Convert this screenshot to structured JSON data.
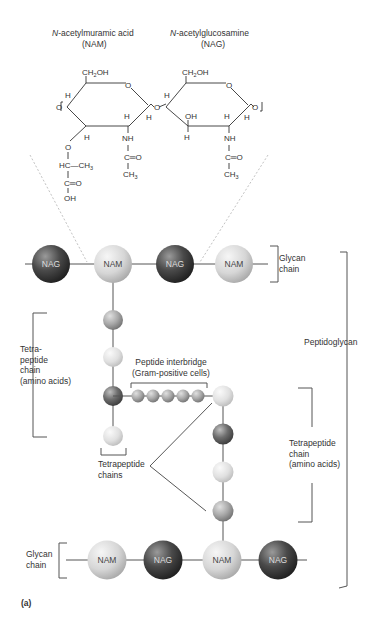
{
  "title": {
    "nam_name": "N-acetylmuramic acid",
    "nam_italic": "N",
    "nam_rest": "-acetylmuramic acid",
    "nam_abbr": "(NAM)",
    "nag_italic": "N",
    "nag_rest": "-acetylglucosamine",
    "nag_abbr": "(NAG)"
  },
  "chemistry": {
    "nam": {
      "ch2oh": "CH₂OH",
      "ring_o": "O",
      "h_left": "H",
      "o_left": "O",
      "h_right_top": "H",
      "h_right_bottom": "H",
      "h_bottom_left": "H",
      "nh": "NH",
      "co": "C═O",
      "ch3": "CH₃",
      "lactyl_o": "O",
      "hc": "HC",
      "hc_ch3": "—CH₃",
      "cooh_c": "C═O",
      "oh": "OH",
      "glycosidic_o": "O"
    },
    "nag": {
      "ch2oh": "CH₂OH",
      "ring_o": "O",
      "h_left": "H",
      "oh": "OH",
      "h_oh": "H",
      "h_right_top": "H",
      "h_right_bottom": "H",
      "nh": "NH",
      "co": "C═O",
      "ch3": "CH₃",
      "o_right": "O"
    }
  },
  "top_glycan_chain": {
    "units": [
      "NAG",
      "NAM",
      "NAG",
      "NAM"
    ],
    "label": "Glycan\nchain"
  },
  "bottom_glycan_chain": {
    "units": [
      "NAM",
      "NAG",
      "NAM",
      "NAG"
    ],
    "label": "Glycan\nchain"
  },
  "labels": {
    "left_tetrapeptide": "Tetra-\npeptide\nchain\n(amino acids)",
    "interbridge": "Peptide interbridge\n(Gram-positive cells)",
    "tetrapeptide_chains": "Tetrapeptide\nchains",
    "right_tetrapeptide": "Tetrapeptide\nchain\n(amino acids)",
    "peptidoglycan": "Peptidoglycan",
    "panel": "(a)"
  },
  "colors": {
    "nag_dark": "#3a3a3a",
    "nam_light": "#d8d8d8",
    "amino_mid": "#a8a8a8",
    "amino_light": "#e2e2e2",
    "line": "#555555"
  }
}
